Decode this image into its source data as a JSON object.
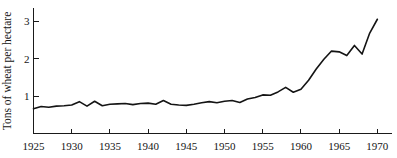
{
  "figure": {
    "background_color": "#ffffff",
    "line_color": "#141414",
    "axis_color": "#1a1a1a",
    "text_color": "#151515"
  },
  "axes": {
    "y_title": "Tons of wheat per hectare",
    "x_title": "",
    "y_ticks": [
      "1",
      "2",
      "3"
    ],
    "x_ticks": [
      "1925",
      "1930",
      "1935",
      "1940",
      "1945",
      "1950",
      "1955",
      "1960",
      "1965",
      "1970"
    ]
  },
  "chart_data": {
    "type": "line",
    "title": "",
    "xlabel": "",
    "ylabel": "Tons of wheat per hectare",
    "xlim": [
      1925,
      1971
    ],
    "ylim": [
      0,
      3.35
    ],
    "grid": false,
    "legend": false,
    "x_tick_values": [
      1925,
      1930,
      1935,
      1940,
      1945,
      1950,
      1955,
      1960,
      1965,
      1970
    ],
    "y_tick_values": [
      1,
      2,
      3
    ],
    "series": [
      {
        "name": "Wheat yield",
        "color": "#141414",
        "x": [
          1925,
          1926,
          1927,
          1928,
          1929,
          1930,
          1931,
          1932,
          1933,
          1934,
          1935,
          1936,
          1937,
          1938,
          1939,
          1940,
          1941,
          1942,
          1943,
          1944,
          1945,
          1946,
          1947,
          1948,
          1949,
          1950,
          1951,
          1952,
          1953,
          1954,
          1955,
          1956,
          1957,
          1958,
          1959,
          1960,
          1961,
          1962,
          1963,
          1964,
          1965,
          1966,
          1967,
          1968,
          1969,
          1970
        ],
        "values": [
          0.66,
          0.72,
          0.7,
          0.73,
          0.74,
          0.76,
          0.85,
          0.73,
          0.86,
          0.74,
          0.78,
          0.79,
          0.8,
          0.77,
          0.8,
          0.81,
          0.78,
          0.88,
          0.78,
          0.76,
          0.75,
          0.78,
          0.82,
          0.85,
          0.82,
          0.86,
          0.88,
          0.83,
          0.92,
          0.96,
          1.03,
          1.02,
          1.11,
          1.23,
          1.1,
          1.18,
          1.42,
          1.72,
          1.98,
          2.2,
          2.18,
          2.08,
          2.35,
          2.12,
          2.68,
          3.05
        ]
      }
    ]
  }
}
